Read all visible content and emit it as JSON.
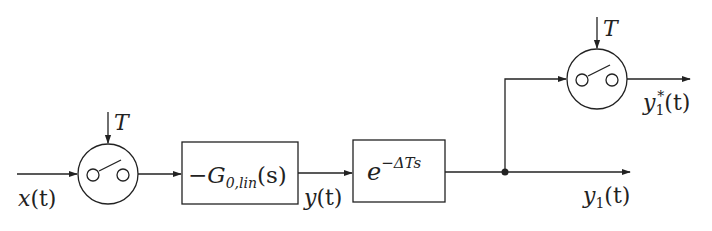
{
  "diagram": {
    "type": "block-diagram",
    "signals": {
      "input": {
        "var": "x",
        "arg": "(t)"
      },
      "intermediate": {
        "var": "y",
        "arg": "(t)"
      },
      "output": {
        "var": "y",
        "sub": "1",
        "arg": "(t)"
      },
      "sampled_output": {
        "var": "y",
        "sub": "1",
        "sup": "*",
        "arg": "(t)"
      }
    },
    "samplers": [
      {
        "id": "sampler-1",
        "period_label": "T"
      },
      {
        "id": "sampler-2",
        "period_label": "T"
      }
    ],
    "blocks": [
      {
        "id": "plant",
        "minus": "−",
        "name": "G",
        "sub": "0,lin",
        "arg": "(s)"
      },
      {
        "id": "delay",
        "base": "e",
        "exponent": "−ΔTs"
      }
    ],
    "connections": [
      "x(t) → sampler-1",
      "sampler-1 → plant",
      "plant → delay (y(t))",
      "delay → junction",
      "junction → y1(t)",
      "junction → sampler-2 → y1*(t)"
    ]
  }
}
